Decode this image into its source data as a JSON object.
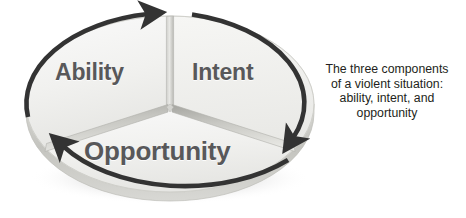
{
  "figure": {
    "name": "three-components-of-a-violent-situation",
    "type": "cycle-pie-diagram",
    "segments": [
      {
        "id": "ability",
        "label": "Ability"
      },
      {
        "id": "intent",
        "label": "Intent"
      },
      {
        "id": "opportunity",
        "label": "Opportunity"
      }
    ],
    "arrows": [
      {
        "id": "arrow-top",
        "direction": "clockwise",
        "from": "opportunity-to-ability",
        "to": "intent"
      },
      {
        "id": "arrow-right",
        "direction": "clockwise",
        "from": "intent",
        "to": "opportunity"
      },
      {
        "id": "arrow-bottom-left",
        "direction": "clockwise",
        "from": "opportunity",
        "to": "ability"
      }
    ],
    "caption": {
      "lines": [
        "The three components",
        "of a violent situation:",
        "ability, intent, and",
        "opportunity"
      ]
    },
    "colors": {
      "segment_fill": "#f1f1ef",
      "segment_fill_shadow": "#e3e3e0",
      "label_text": "#58585a",
      "caption_text": "#231f20",
      "arrow_stroke": "#333333",
      "divider_light": "#d9d9d6",
      "divider_dark": "#a9a9a6",
      "disc_rim": "#c9c9c5",
      "background": "#ffffff"
    }
  }
}
